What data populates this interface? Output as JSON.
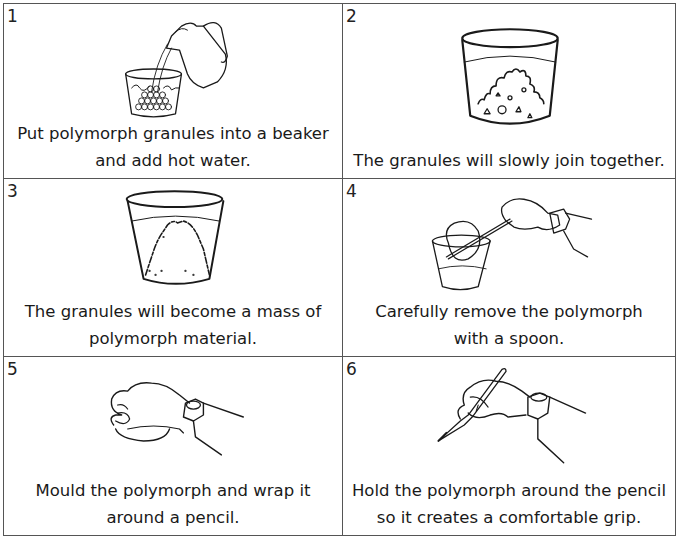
{
  "steps": [
    {
      "number": "1",
      "caption": [
        "Put polymorph granules into a beaker",
        "and add hot water."
      ],
      "illustration": "jug-pouring-water-into-beaker-of-granules"
    },
    {
      "number": "2",
      "caption": [
        "The granules will slowly join together."
      ],
      "illustration": "beaker-with-joining-granules"
    },
    {
      "number": "3",
      "caption": [
        "The granules will become a mass of",
        "polymorph material."
      ],
      "illustration": "beaker-with-polymorph-mass"
    },
    {
      "number": "4",
      "caption": [
        "Carefully remove the polymorph",
        "with a spoon."
      ],
      "illustration": "hand-lifting-polymorph-with-spoon"
    },
    {
      "number": "5",
      "caption": [
        "Mould the polymorph and wrap it",
        "around a pencil."
      ],
      "illustration": "hand-moulding-polymorph"
    },
    {
      "number": "6",
      "caption": [
        "Hold the polymorph around the pencil",
        "so it creates a comfortable grip."
      ],
      "illustration": "hand-holding-pencil-with-grip"
    }
  ],
  "colors": {
    "line": "#1a1a1a",
    "border": "#555555",
    "background": "#ffffff"
  }
}
